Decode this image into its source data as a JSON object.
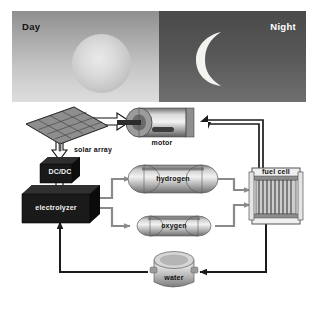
{
  "figure": {
    "type": "process-flow-diagram"
  },
  "sky": {
    "day_label": "Day",
    "night_label": "Night",
    "sun_icon": "sun-icon",
    "moon_icon": "crescent-moon-icon",
    "day_gradient_top": "#8f8f8f",
    "day_gradient_bottom": "#dedede",
    "night_gradient_top": "#4a4a4a",
    "night_gradient_bottom": "#6f6f6f"
  },
  "nodes": [
    {
      "id": "solar-array",
      "label": "solar array",
      "icon": "solar-panel-icon"
    },
    {
      "id": "dcdc",
      "label": "DC/DC",
      "icon": "converter-box-icon"
    },
    {
      "id": "electrolyzer",
      "label": "electrolyzer",
      "icon": "electrolyzer-box-icon"
    },
    {
      "id": "hydrogen",
      "label": "hydrogen",
      "icon": "gas-tank-icon"
    },
    {
      "id": "oxygen",
      "label": "oxygen",
      "icon": "gas-tank-icon"
    },
    {
      "id": "fuel-cell",
      "label": "fuel cell",
      "icon": "fuel-cell-stack-icon"
    },
    {
      "id": "water",
      "label": "water",
      "icon": "water-tank-icon"
    },
    {
      "id": "motor",
      "label": "motor",
      "icon": "electric-motor-icon"
    }
  ],
  "flows": [
    {
      "from": "solar-array",
      "to": "motor",
      "kind": "electrical-hollow"
    },
    {
      "from": "solar-array",
      "to": "dcdc",
      "kind": "electrical-hollow"
    },
    {
      "from": "dcdc",
      "to": "electrolyzer",
      "kind": "electrical-hollow"
    },
    {
      "from": "electrolyzer",
      "to": "hydrogen",
      "kind": "gas-pipe"
    },
    {
      "from": "electrolyzer",
      "to": "oxygen",
      "kind": "gas-pipe"
    },
    {
      "from": "hydrogen",
      "to": "fuel-cell",
      "kind": "gas-pipe"
    },
    {
      "from": "oxygen",
      "to": "fuel-cell",
      "kind": "gas-pipe"
    },
    {
      "from": "fuel-cell",
      "to": "water",
      "kind": "water-pipe"
    },
    {
      "from": "water",
      "to": "electrolyzer",
      "kind": "water-pipe"
    },
    {
      "from": "fuel-cell",
      "to": "motor",
      "kind": "electrical-wire"
    }
  ],
  "colors": {
    "pipe_gray": "#8a8a8a",
    "wire_black": "#1b1b1b",
    "dark_box": "#1a1a1a",
    "panel_white": "#ffffff"
  }
}
